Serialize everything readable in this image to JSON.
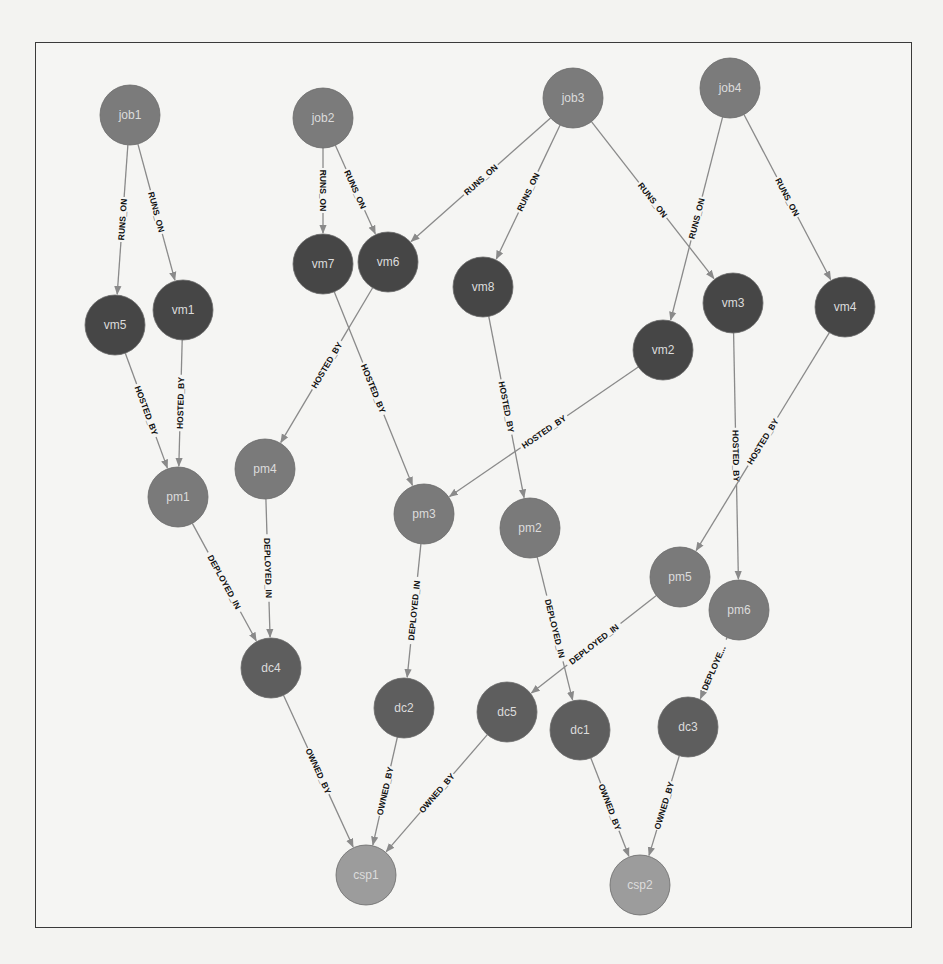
{
  "diagram": {
    "title": "",
    "colors": {
      "job": "#7b7b7b",
      "vm": "#464646",
      "pm": "#7a7a7a",
      "dc": "#5e5e5e",
      "csp": "#9c9c9c",
      "edge": "#8a8a8a",
      "edge_label": "#111111",
      "node_label": "#dcdcdc"
    },
    "node_radius": 30,
    "nodes": [
      {
        "id": "job1",
        "label": "job1",
        "type": "job",
        "x": 130,
        "y": 115
      },
      {
        "id": "job2",
        "label": "job2",
        "type": "job",
        "x": 323,
        "y": 118
      },
      {
        "id": "job3",
        "label": "job3",
        "type": "job",
        "x": 573,
        "y": 98
      },
      {
        "id": "job4",
        "label": "job4",
        "type": "job",
        "x": 730,
        "y": 88
      },
      {
        "id": "vm5",
        "label": "vm5",
        "type": "vm",
        "x": 115,
        "y": 325
      },
      {
        "id": "vm1",
        "label": "vm1",
        "type": "vm",
        "x": 183,
        "y": 310
      },
      {
        "id": "vm7",
        "label": "vm7",
        "type": "vm",
        "x": 323,
        "y": 264
      },
      {
        "id": "vm6",
        "label": "vm6",
        "type": "vm",
        "x": 388,
        "y": 262
      },
      {
        "id": "vm8",
        "label": "vm8",
        "type": "vm",
        "x": 483,
        "y": 287
      },
      {
        "id": "vm2",
        "label": "vm2",
        "type": "vm",
        "x": 663,
        "y": 350
      },
      {
        "id": "vm3",
        "label": "vm3",
        "type": "vm",
        "x": 733,
        "y": 303
      },
      {
        "id": "vm4",
        "label": "vm4",
        "type": "vm",
        "x": 845,
        "y": 307
      },
      {
        "id": "pm1",
        "label": "pm1",
        "type": "pm",
        "x": 178,
        "y": 497
      },
      {
        "id": "pm4",
        "label": "pm4",
        "type": "pm",
        "x": 265,
        "y": 469
      },
      {
        "id": "pm3",
        "label": "pm3",
        "type": "pm",
        "x": 424,
        "y": 514
      },
      {
        "id": "pm2",
        "label": "pm2",
        "type": "pm",
        "x": 530,
        "y": 528
      },
      {
        "id": "pm5",
        "label": "pm5",
        "type": "pm",
        "x": 680,
        "y": 577
      },
      {
        "id": "pm6",
        "label": "pm6",
        "type": "pm",
        "x": 739,
        "y": 610
      },
      {
        "id": "dc4",
        "label": "dc4",
        "type": "dc",
        "x": 271,
        "y": 668
      },
      {
        "id": "dc2",
        "label": "dc2",
        "type": "dc",
        "x": 404,
        "y": 708
      },
      {
        "id": "dc5",
        "label": "dc5",
        "type": "dc",
        "x": 507,
        "y": 712
      },
      {
        "id": "dc1",
        "label": "dc1",
        "type": "dc",
        "x": 580,
        "y": 730
      },
      {
        "id": "dc3",
        "label": "dc3",
        "type": "dc",
        "x": 688,
        "y": 727
      },
      {
        "id": "csp1",
        "label": "csp1",
        "type": "csp",
        "x": 366,
        "y": 875
      },
      {
        "id": "csp2",
        "label": "csp2",
        "type": "csp",
        "x": 640,
        "y": 885
      }
    ],
    "edges": [
      {
        "from": "job1",
        "to": "vm5",
        "label": "RUNS_ON"
      },
      {
        "from": "job1",
        "to": "vm1",
        "label": "RUNS_ON"
      },
      {
        "from": "job2",
        "to": "vm7",
        "label": "RUNS_ON"
      },
      {
        "from": "job2",
        "to": "vm6",
        "label": "RUNS_ON"
      },
      {
        "from": "job3",
        "to": "vm6",
        "label": "RUNS_ON"
      },
      {
        "from": "job3",
        "to": "vm8",
        "label": "RUNS_ON"
      },
      {
        "from": "job3",
        "to": "vm3",
        "label": "RUNS_ON"
      },
      {
        "from": "job4",
        "to": "vm2",
        "label": "RUNS_ON"
      },
      {
        "from": "job4",
        "to": "vm4",
        "label": "RUNS_ON"
      },
      {
        "from": "vm5",
        "to": "pm1",
        "label": "HOSTED_BY"
      },
      {
        "from": "vm1",
        "to": "pm1",
        "label": "HOSTED_BY"
      },
      {
        "from": "vm6",
        "to": "pm4",
        "label": "HOSTED_BY"
      },
      {
        "from": "vm7",
        "to": "pm3",
        "label": "HOSTED_BY"
      },
      {
        "from": "vm8",
        "to": "pm2",
        "label": "HOSTED_BY"
      },
      {
        "from": "vm2",
        "to": "pm3",
        "label": "HOSTED_BY"
      },
      {
        "from": "vm3",
        "to": "pm6",
        "label": "HOSTED_BY"
      },
      {
        "from": "vm4",
        "to": "pm5",
        "label": "HOSTED_BY"
      },
      {
        "from": "pm1",
        "to": "dc4",
        "label": "DEPLOYED_IN"
      },
      {
        "from": "pm4",
        "to": "dc4",
        "label": "DEPLOYED_IN"
      },
      {
        "from": "pm3",
        "to": "dc2",
        "label": "DEPLOYED_IN"
      },
      {
        "from": "pm2",
        "to": "dc1",
        "label": "DEPLOYED_IN"
      },
      {
        "from": "pm5",
        "to": "dc5",
        "label": "DEPLOYED_IN"
      },
      {
        "from": "pm6",
        "to": "dc3",
        "label": "DEPLOYE..."
      },
      {
        "from": "dc4",
        "to": "csp1",
        "label": "OWNED_BY"
      },
      {
        "from": "dc2",
        "to": "csp1",
        "label": "OWNED_BY"
      },
      {
        "from": "dc5",
        "to": "csp1",
        "label": "OWNED_BY"
      },
      {
        "from": "dc1",
        "to": "csp2",
        "label": "OWNED_BY"
      },
      {
        "from": "dc3",
        "to": "csp2",
        "label": "OWNED_BY"
      }
    ]
  }
}
